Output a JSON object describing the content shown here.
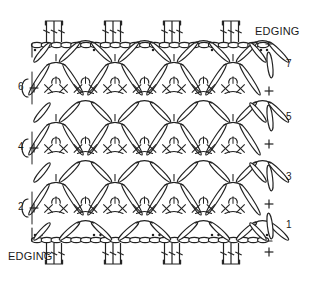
{
  "diagram": {
    "kind": "crochet-stitch-chart",
    "title": "",
    "background_color": "#ffffff",
    "stroke_color": "#222222",
    "fill_color": "#ffffff",
    "width": 311,
    "height": 282
  },
  "labels": {
    "edging_top": {
      "text": "EDGING",
      "x": 255,
      "y": 33
    },
    "edging_bottom": {
      "text": "EDGING",
      "x": 8,
      "y": 257
    }
  },
  "row_numbers": {
    "left_side": [
      {
        "text": "6",
        "x": 18,
        "y": 88
      },
      {
        "text": "4",
        "x": 18,
        "y": 148
      },
      {
        "text": "2",
        "x": 18,
        "y": 208
      }
    ],
    "right_side": [
      {
        "text": "7",
        "x": 272,
        "y": 65
      },
      {
        "text": "5",
        "x": 272,
        "y": 118
      },
      {
        "text": "3",
        "x": 272,
        "y": 178
      },
      {
        "text": "1",
        "x": 272,
        "y": 226
      }
    ]
  },
  "chart_data": {
    "type": "diagram",
    "legend": [],
    "body_rows": [
      {
        "number": 2,
        "y": 208,
        "motifs": 4
      },
      {
        "number": 3,
        "y": 178,
        "motifs": 4
      },
      {
        "number": 4,
        "y": 148,
        "motifs": 4
      },
      {
        "number": 5,
        "y": 118,
        "motifs": 4
      },
      {
        "number": 6,
        "y": 88,
        "motifs": 4
      },
      {
        "number": 7,
        "y": 65,
        "motifs": 4
      }
    ],
    "edging": {
      "top_y": 45,
      "bottom_y": 240,
      "chain_groups": 4,
      "stitches_per_group": 3,
      "picot_dots_per_gap": 2
    },
    "geometry": {
      "left_x": 32,
      "right_x": 268,
      "motif_pitch": 59,
      "row_pitch": 30
    }
  }
}
